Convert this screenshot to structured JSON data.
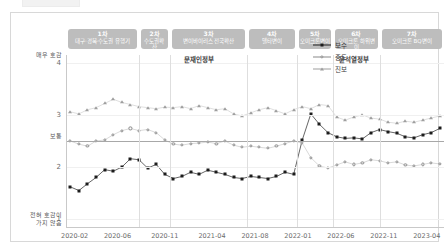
{
  "figure": {
    "y_axis": {
      "ticks": [
        {
          "value": 4,
          "label": "4"
        },
        {
          "value": 3,
          "label": "3"
        },
        {
          "value": 2,
          "label": "2"
        },
        {
          "value": 1,
          "label": "1"
        }
      ],
      "top_desc": "매우 호감",
      "mid_desc": "보통",
      "bottom_desc": "전혀 호감이\n가지 않음",
      "range": [
        0.85,
        4.15
      ]
    },
    "x_axis": {
      "tick_labels": [
        "2020-02",
        "2020-06",
        "2020-11",
        "2021-04",
        "2021-08",
        "2022-01",
        "2022-06",
        "2022-11",
        "2023-04"
      ],
      "tick_positions": [
        0.5,
        5.5,
        11.0,
        16.5,
        21.5,
        26.5,
        31.5,
        36.5,
        41.5
      ]
    },
    "waves": [
      {
        "num": "1차",
        "name": "대구·경북·수도권 유행기",
        "start": -0.5,
        "end": 8.0
      },
      {
        "num": "2차",
        "name": "수도권확산",
        "start": 8.0,
        "end": 11.6
      },
      {
        "num": "3차",
        "name": "변이바이러스 전국확산",
        "start": 11.6,
        "end": 20.6
      },
      {
        "num": "4차",
        "name": "델타변이",
        "start": 20.6,
        "end": 26.4
      },
      {
        "num": "5차",
        "name": "오미크론변이",
        "start": 26.4,
        "end": 30.6
      },
      {
        "num": "6차",
        "name": "오미크론 하위변이",
        "start": 30.6,
        "end": 36.0
      },
      {
        "num": "7차",
        "name": "오미크론 BQ변이",
        "start": 36.0,
        "end": 43.5
      }
    ],
    "governments": [
      {
        "label": "문재인정부",
        "position": 15.0
      },
      {
        "label": "윤석열정부",
        "position": 33.0
      }
    ],
    "legend": {
      "position": "inside-top-right",
      "entries": [
        {
          "label": "보수",
          "marker": "square",
          "color": "#1c1c1c"
        },
        {
          "label": "중도",
          "marker": "ring",
          "color": "#8a8a8a"
        },
        {
          "label": "진보",
          "marker": "triangle",
          "color": "#9e9e9e"
        }
      ]
    },
    "reference_line": {
      "value": 2.5,
      "label": "보통"
    }
  },
  "chart_data": {
    "type": "line",
    "title": "",
    "subtitle": "",
    "xlabel": "",
    "ylabel": "호감도",
    "xlim": [
      -0.5,
      43.5
    ],
    "ylim": [
      0.85,
      4.15
    ],
    "grid": false,
    "legend_position": "inside-top-right",
    "x": [
      "2020-02",
      "2020-03",
      "2020-04",
      "2020-05",
      "2020-06",
      "2020-07",
      "2020-08",
      "2020-09",
      "2020-10",
      "2020-11",
      "2020-12",
      "2021-01",
      "2021-02",
      "2021-03",
      "2021-04",
      "2021-05",
      "2021-06",
      "2021-07",
      "2021-08",
      "2021-09",
      "2021-10",
      "2021-11",
      "2021-12",
      "2022-01",
      "2022-02",
      "2022-03",
      "2022-04",
      "2022-05",
      "2022-06",
      "2022-07",
      "2022-08",
      "2022-09",
      "2022-10",
      "2022-11",
      "2022-12",
      "2023-01",
      "2023-02",
      "2023-03",
      "2023-04",
      "2023-05",
      "2023-06",
      "2023-07",
      "2023-08",
      "2023-09"
    ],
    "series": [
      {
        "name": "보수",
        "marker": "square",
        "color": "#1c1c1c",
        "values": [
          1.62,
          1.55,
          1.68,
          1.8,
          1.95,
          1.92,
          2.0,
          2.16,
          2.14,
          1.98,
          2.05,
          1.86,
          1.78,
          1.82,
          1.9,
          1.86,
          1.94,
          1.9,
          1.86,
          1.8,
          1.78,
          1.82,
          1.8,
          1.78,
          1.82,
          1.9,
          1.86,
          2.52,
          3.02,
          2.82,
          2.66,
          2.58,
          2.55,
          2.56,
          2.54,
          2.66,
          2.72,
          2.68,
          2.65,
          2.58,
          2.56,
          2.62,
          2.66,
          2.74
        ]
      },
      {
        "name": "중도",
        "marker": "ring",
        "color": "#8a8a8a",
        "values": [
          2.5,
          2.44,
          2.4,
          2.5,
          2.52,
          2.62,
          2.7,
          2.74,
          2.7,
          2.72,
          2.66,
          2.52,
          2.44,
          2.42,
          2.45,
          2.46,
          2.48,
          2.45,
          2.5,
          2.42,
          2.38,
          2.4,
          2.38,
          2.36,
          2.4,
          2.45,
          2.5,
          2.46,
          2.18,
          2.02,
          1.98,
          2.04,
          2.1,
          2.05,
          2.08,
          2.14,
          2.12,
          2.08,
          2.1,
          2.04,
          2.02,
          2.05,
          2.08,
          2.06
        ]
      },
      {
        "name": "진보",
        "marker": "triangle",
        "color": "#9e9e9e",
        "values": [
          3.06,
          3.02,
          3.1,
          3.14,
          3.22,
          3.3,
          3.24,
          3.2,
          3.16,
          3.14,
          3.12,
          3.15,
          3.14,
          3.16,
          3.12,
          3.18,
          3.14,
          3.1,
          3.12,
          3.02,
          2.98,
          3.04,
          3.1,
          3.14,
          3.08,
          3.02,
          3.1,
          3.16,
          3.12,
          3.2,
          3.18,
          2.96,
          2.9,
          2.96,
          3.0,
          2.94,
          2.92,
          2.86,
          2.84,
          2.88,
          2.86,
          2.9,
          2.94,
          2.98
        ]
      }
    ]
  }
}
